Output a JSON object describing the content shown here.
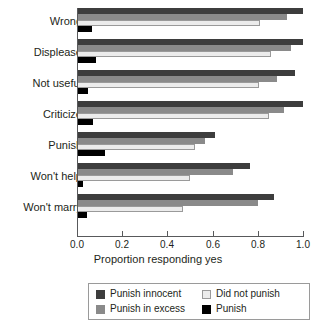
{
  "chart_data": {
    "type": "bar",
    "orientation": "horizontal",
    "title": "",
    "xlabel": "Proportion responding yes",
    "ylabel": "",
    "xlim": [
      0.0,
      1.0
    ],
    "grid": false,
    "legend_position": "bottom",
    "categories": [
      "Wrong",
      "Displease",
      "Not useful",
      "Criticize",
      "Punish",
      "Won't help",
      "Won't marry"
    ],
    "xtick_labels": [
      "0.0",
      "0.2",
      "0.4",
      "0.6",
      "0.8",
      "1.0"
    ],
    "xtick_values": [
      0.0,
      0.2,
      0.4,
      0.6,
      0.8,
      1.0
    ],
    "series": [
      {
        "name": "Punish innocent",
        "color": "#3d3d3d",
        "values": [
          1.0,
          1.0,
          0.965,
          1.0,
          0.61,
          0.765,
          0.87
        ]
      },
      {
        "name": "Punish in excess",
        "color": "#8a8a8a",
        "values": [
          0.93,
          0.945,
          0.885,
          0.915,
          0.565,
          0.69,
          0.8
        ]
      },
      {
        "name": "Did not punish",
        "color": "#ececec",
        "values": [
          0.81,
          0.86,
          0.805,
          0.85,
          0.52,
          0.5,
          0.47
        ]
      },
      {
        "name": "Punish",
        "color": "#000000",
        "values": [
          0.065,
          0.085,
          0.05,
          0.07,
          0.125,
          0.025,
          0.045
        ]
      }
    ]
  },
  "legend": {
    "entries": [
      {
        "label": "Punish innocent",
        "swatch": "dark"
      },
      {
        "label": "Did not punish",
        "swatch": "light"
      },
      {
        "label": "Punish in excess",
        "swatch": "mid"
      },
      {
        "label": "Punish",
        "swatch": "black"
      }
    ]
  }
}
